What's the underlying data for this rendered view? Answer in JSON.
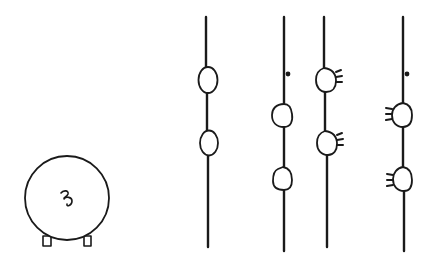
{
  "figure": {
    "type": "line-drawing",
    "colors": {
      "ink": "#1a1a1a",
      "background": "#ffffff"
    },
    "round_body": {
      "symbol": "curl",
      "feet": 2
    },
    "strands": [
      {
        "id": "strand-1",
        "swellings": 2,
        "projections": "none",
        "dot": false
      },
      {
        "id": "strand-2",
        "swellings": 2,
        "projections": "none",
        "dot": true
      },
      {
        "id": "strand-3",
        "swellings": 2,
        "projections": "right",
        "dot": false
      },
      {
        "id": "strand-4",
        "swellings": 2,
        "projections": "left",
        "dot": true
      }
    ]
  }
}
